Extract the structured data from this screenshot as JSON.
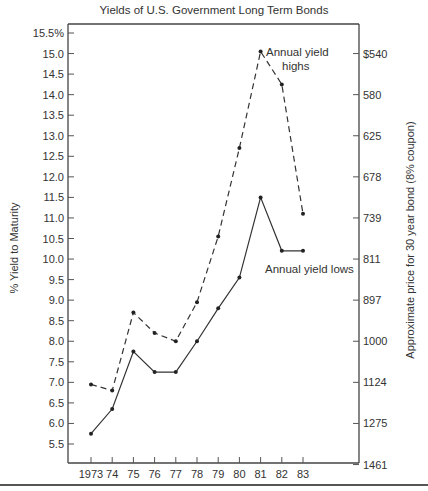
{
  "chart_data": {
    "type": "line",
    "title": "Yields of U.S. Government Long Term Bonds",
    "xlabel": "",
    "ylabel": "% Yield to Maturity",
    "ylabel_right": "Approximate price for 30 year bond (8% coupon)",
    "categories": [
      "1973",
      "74",
      "75",
      "76",
      "77",
      "78",
      "79",
      "80",
      "81",
      "82",
      "83"
    ],
    "x": [
      1973,
      1974,
      1975,
      1976,
      1977,
      1978,
      1979,
      1980,
      1981,
      1982,
      1983
    ],
    "series": [
      {
        "name": "Annual yield highs",
        "style": "dashed",
        "values": [
          6.95,
          6.8,
          8.7,
          8.2,
          8.0,
          8.95,
          10.55,
          12.7,
          15.05,
          14.25,
          11.1
        ]
      },
      {
        "name": "Annual yield lows",
        "style": "solid",
        "values": [
          5.75,
          6.35,
          7.75,
          7.25,
          7.25,
          8.0,
          8.8,
          9.55,
          11.5,
          10.2,
          10.2
        ]
      }
    ],
    "ylim": [
      5.0,
      15.7
    ],
    "yticks": [
      "15.5%",
      "15.0",
      "14.5",
      "14.0",
      "13.5",
      "13.0",
      "12.5",
      "12.0",
      "11.5",
      "11.0",
      "10.5",
      "10.0",
      "9.5",
      "9.0",
      "8.5",
      "8.0",
      "7.5",
      "7.0",
      "6.5",
      "6.0",
      "5.5"
    ],
    "ytick_values": [
      15.5,
      15.0,
      14.5,
      14.0,
      13.5,
      13.0,
      12.5,
      12.0,
      11.5,
      11.0,
      10.5,
      10.0,
      9.5,
      9.0,
      8.5,
      8.0,
      7.5,
      7.0,
      6.5,
      6.0,
      5.5
    ],
    "right_axis": {
      "ticks": [
        "$540",
        "580",
        "625",
        "678",
        "739",
        "811",
        "897",
        "1000",
        "1124",
        "1275",
        "1461"
      ],
      "aligned_yields": [
        15,
        14,
        13,
        12,
        11,
        10,
        9,
        8,
        7,
        6,
        5
      ]
    },
    "annotations": [
      {
        "text": "Annual yield highs",
        "lines": [
          "Annual yield",
          "highs"
        ],
        "near": "1981 high"
      },
      {
        "text": "Annual yield lows",
        "near": "1982-83 lows"
      }
    ],
    "grid": false,
    "legend": "inline annotations"
  }
}
